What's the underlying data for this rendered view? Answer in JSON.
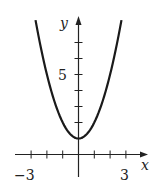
{
  "chart_data": {
    "type": "line",
    "title": "",
    "function": "y = x^2 + 1",
    "xlabel": "x",
    "ylabel": "y",
    "xlim": [
      -3.4,
      4.3
    ],
    "ylim": [
      -1.5,
      8.6
    ],
    "x_ticks": [
      -3,
      -2,
      -1,
      1,
      2,
      3
    ],
    "y_ticks": [
      1,
      2,
      3,
      4,
      5,
      6,
      7
    ],
    "x_tick_labels": [
      {
        "value": -3,
        "label": "−3"
      },
      {
        "value": 3,
        "label": "3"
      }
    ],
    "y_tick_labels": [
      {
        "value": 5,
        "label": "5"
      }
    ],
    "grid": false,
    "series": [
      {
        "name": "y = x^2 + 1",
        "x": [
          -2.7,
          -2,
          -1,
          0,
          1,
          2,
          2.7
        ],
        "values": [
          8.29,
          5,
          2,
          1,
          2,
          5,
          8.29
        ]
      }
    ]
  },
  "labels": {
    "x_axis": "x",
    "y_axis": "y",
    "x_min_label": "−3",
    "x_max_label": "3",
    "y_label_5": "5"
  }
}
